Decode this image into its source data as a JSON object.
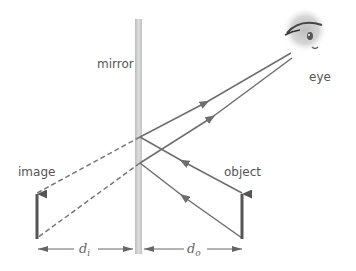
{
  "diagram": {
    "labels": {
      "mirror": "mirror",
      "eye": "eye",
      "image": "image",
      "object": "object",
      "d_image": "d",
      "d_image_sub": "i",
      "d_object": "d",
      "d_object_sub": "o"
    },
    "colors": {
      "ray": "#6e6e6e",
      "arrow": "#555555",
      "mirror": "#c9c9c9",
      "label": "#555555"
    }
  }
}
